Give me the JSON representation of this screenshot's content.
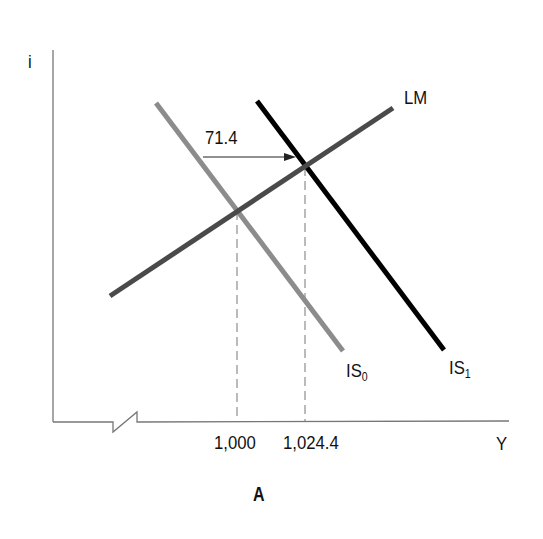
{
  "diagram": {
    "type": "IS-LM",
    "panel_label": "A",
    "axes": {
      "y_label": "i",
      "x_label": "Y",
      "x_axis_break": true
    },
    "curves": [
      {
        "name": "LM",
        "label": "LM",
        "label_sub": "",
        "color": "#4a4a4a"
      },
      {
        "name": "IS0",
        "label": "IS",
        "label_sub": "0",
        "color": "#8c8c8c"
      },
      {
        "name": "IS1",
        "label": "IS",
        "label_sub": "1",
        "color": "#000000"
      }
    ],
    "shift_annotation": "71.4",
    "x_ticks": [
      "1,000",
      "1,024.4"
    ]
  }
}
